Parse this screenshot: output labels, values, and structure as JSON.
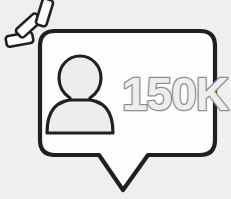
{
  "illustration": {
    "name": "follower-count-speech-bubble",
    "alt_label": "Speech bubble with person icon and follower count",
    "background_color": "#efefed",
    "bubble": {
      "name": "speech-bubble",
      "fill_color": "#fdfdfd",
      "stroke_color": "#231f20",
      "stroke_width": 4,
      "corner_radius": 14
    },
    "tail": {
      "name": "speech-bubble-tail",
      "direction": "down"
    },
    "person_icon": {
      "name": "person-icon",
      "fill_color": "#ededed",
      "stroke_color": "#231f20",
      "stroke_width": 3
    },
    "count": {
      "name": "follower-count",
      "value": "150K",
      "fill_color": "#ededed",
      "stroke_color": "#8d8d8d"
    },
    "sparkles": {
      "name": "sparkle-marks",
      "count": 3,
      "fill_color": "#ffffff",
      "stroke_color": "#231f20",
      "marks": [
        {
          "label": "sparkle-dash-1",
          "angle": -12
        },
        {
          "label": "sparkle-dash-2",
          "angle": -42
        },
        {
          "label": "sparkle-dash-3",
          "angle": -72
        }
      ]
    }
  }
}
